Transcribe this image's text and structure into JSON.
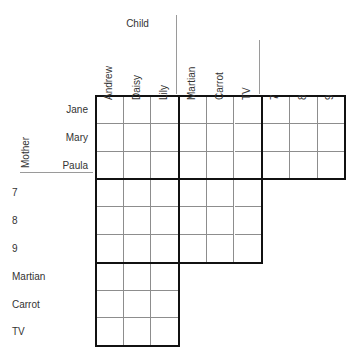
{
  "puzzle": {
    "type": "logic-grid",
    "column_groups": [
      {
        "title": "Child",
        "items": [
          "Andrew",
          "Daisy",
          "Lily"
        ]
      },
      {
        "title": "",
        "items": [
          "Martian",
          "Carrot",
          "TV"
        ]
      },
      {
        "title": "",
        "items": [
          "7",
          "8",
          "9"
        ]
      }
    ],
    "row_groups": [
      {
        "title": "Mother",
        "items": [
          "Jane",
          "Mary",
          "Paula"
        ],
        "align": "right"
      },
      {
        "title": "",
        "items": [
          "7",
          "8",
          "9"
        ],
        "align": "left"
      },
      {
        "title": "",
        "items": [
          "Martian",
          "Carrot",
          "TV"
        ],
        "align": "left"
      }
    ],
    "cells": [
      [
        "",
        "",
        "",
        "",
        "",
        "",
        "",
        "",
        ""
      ],
      [
        "",
        "",
        "",
        "",
        "",
        "",
        "",
        "",
        ""
      ],
      [
        "",
        "",
        "",
        "",
        "",
        "",
        "",
        "",
        ""
      ],
      [
        "",
        "",
        "",
        "",
        "",
        "",
        null,
        null,
        null
      ],
      [
        "",
        "",
        "",
        "",
        "",
        "",
        null,
        null,
        null
      ],
      [
        "",
        "",
        "",
        "",
        "",
        "",
        null,
        null,
        null
      ],
      [
        "",
        "",
        "",
        null,
        null,
        null,
        null,
        null,
        null
      ],
      [
        "",
        "",
        "",
        null,
        null,
        null,
        null,
        null,
        null
      ],
      [
        "",
        "",
        "",
        null,
        null,
        null,
        null,
        null,
        null
      ]
    ],
    "blocks": [
      {
        "name": "block-mother-child",
        "r0": 0,
        "c0": 0,
        "rows": 3,
        "cols": 3
      },
      {
        "name": "block-mother-gift",
        "r0": 0,
        "c0": 3,
        "rows": 3,
        "cols": 3
      },
      {
        "name": "block-mother-age",
        "r0": 0,
        "c0": 6,
        "rows": 3,
        "cols": 3
      },
      {
        "name": "block-age-child",
        "r0": 3,
        "c0": 0,
        "rows": 3,
        "cols": 3
      },
      {
        "name": "block-age-gift",
        "r0": 3,
        "c0": 3,
        "rows": 3,
        "cols": 3
      },
      {
        "name": "block-gift-child",
        "r0": 6,
        "c0": 0,
        "rows": 3,
        "cols": 3
      }
    ],
    "colors": {
      "background": "#ffffff",
      "block_border": "#111111",
      "cell_border": "#8d8d8d",
      "separator": "#9a9a9a",
      "text": "#333333"
    },
    "geometry": {
      "grid_left": 96,
      "grid_top": 96,
      "cell_w": 27.7,
      "cell_h": 27.8,
      "n_cols": 9,
      "n_rows": 9
    }
  }
}
